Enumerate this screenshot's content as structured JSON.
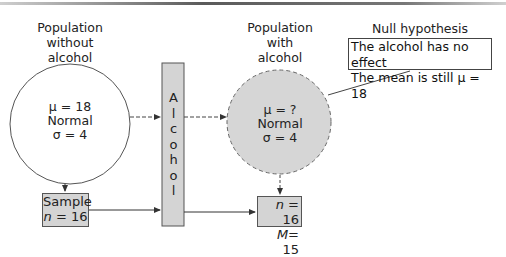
{
  "left_population": {
    "title_lines": [
      "Population",
      "without",
      "alcohol"
    ],
    "params": [
      "μ = 18",
      "Normal",
      "σ = 4"
    ]
  },
  "treatment": {
    "letters": [
      "A",
      "l",
      "c",
      "o",
      "h",
      "o",
      "l"
    ]
  },
  "right_population": {
    "title_lines": [
      "Population",
      "with",
      "alcohol"
    ],
    "params": [
      "μ = ?",
      "Normal",
      "σ = 4"
    ]
  },
  "null_hypothesis": {
    "title": "Null hypothesis",
    "lines": [
      "The alcohol has no effect",
      "The mean is still μ = 18"
    ]
  },
  "sample": {
    "label": "Sample",
    "n_symbol": "n",
    "n_value": " = 16"
  },
  "result": {
    "n_symbol": "n",
    "n_value": " = 16",
    "m_symbol": "M",
    "m_value": "= 15"
  },
  "colors": {
    "fill_gray": "#d4d4d4",
    "stroke": "#555555"
  }
}
